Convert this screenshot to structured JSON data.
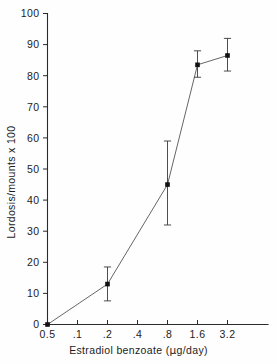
{
  "chart_data": {
    "type": "line",
    "title": "",
    "xlabel": "Estradiol benzoate (µg/day)",
    "ylabel": "Lordosis/mounts x 100",
    "xscale": "log2-dose (evenly spaced categories)",
    "x_categories": [
      "0.5",
      ".1",
      ".2",
      ".4",
      ".8",
      "1.6",
      "3.2"
    ],
    "xtick_labels": [
      "0.5",
      ".1",
      ".2",
      ".4",
      ".8",
      "1.6",
      "3.2"
    ],
    "ytick_labels": [
      "0",
      "10",
      "20",
      "30",
      "40",
      "50",
      "60",
      "70",
      "80",
      "90",
      "100"
    ],
    "ylim": [
      0,
      100
    ],
    "ytick_step": 10,
    "grid": false,
    "legend": false,
    "legend_position": "none",
    "series": [
      {
        "name": "Lordosis/mounts x 100",
        "marker": "filled-square",
        "points": [
          {
            "x_category": "0.5",
            "x_index": 0,
            "value": 0,
            "err_low": 0,
            "err_high": 0,
            "has_error_bar": false
          },
          {
            "x_category": ".2",
            "x_index": 2,
            "value": 13,
            "err_low": 7.6,
            "err_high": 18.5,
            "has_error_bar": true
          },
          {
            "x_category": ".8",
            "x_index": 4,
            "value": 45,
            "err_low": 32,
            "err_high": 59,
            "has_error_bar": true
          },
          {
            "x_category": "1.6",
            "x_index": 5,
            "value": 83.5,
            "err_low": 79.5,
            "err_high": 88,
            "has_error_bar": true
          },
          {
            "x_category": "3.2",
            "x_index": 6,
            "value": 86.5,
            "err_low": 81.5,
            "err_high": 92,
            "has_error_bar": true
          }
        ]
      }
    ],
    "colors": {
      "axis": "#2b2b2b",
      "line": "#555555",
      "marker": "#111111",
      "error_bar": "#3a3a3a",
      "background": "#fefefe",
      "text": "#1c1c1c"
    }
  },
  "axis_titles": {
    "y": "Lordosis/mounts x 100",
    "x_before_mu": "Estradiol  benzoate (",
    "x_mu": "µ",
    "x_after_mu": "g/day)"
  }
}
